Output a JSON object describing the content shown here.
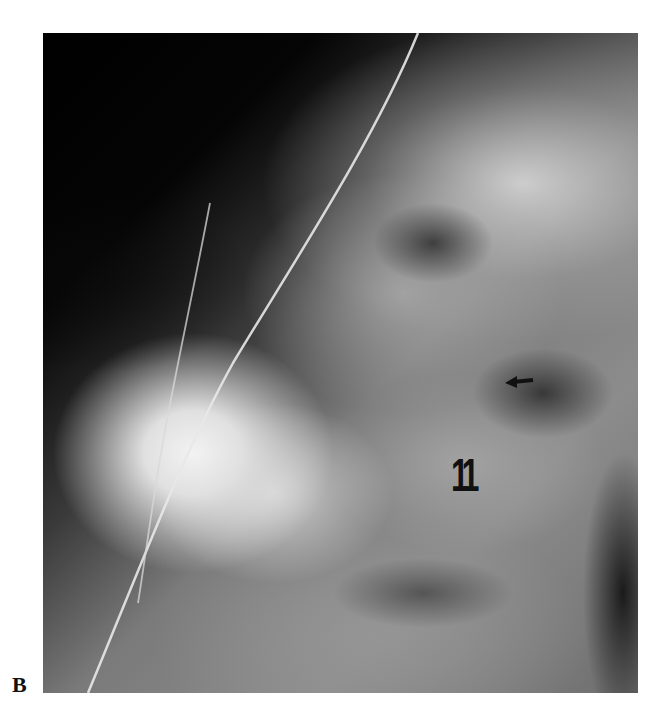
{
  "figure": {
    "panel_label": "B",
    "image_type": "radiograph",
    "annotations": {
      "level_label": "11",
      "arrow": {
        "direction": "left",
        "color": "#111111"
      }
    }
  },
  "colors": {
    "background": "#ffffff",
    "text": "#111111"
  }
}
